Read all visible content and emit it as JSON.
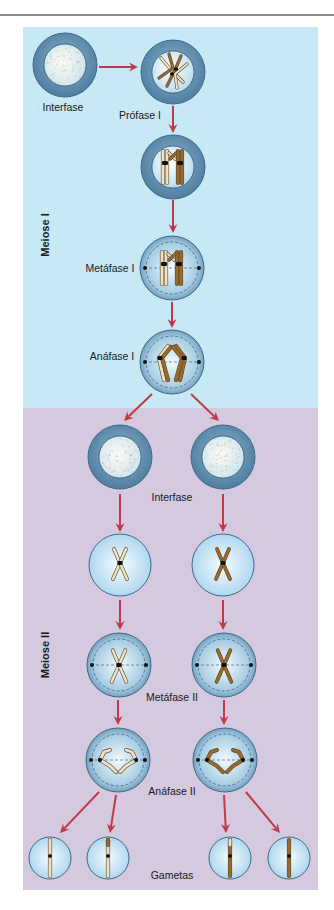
{
  "sections": [
    {
      "id": "meiose1",
      "label": "Meiose I",
      "color": "#c7e9f6",
      "label_pos": [
        45,
        235
      ]
    },
    {
      "id": "meiose2",
      "label": "Meiose II",
      "color": "#d4c9df",
      "label_pos": [
        45,
        655
      ]
    }
  ],
  "stage_labels": [
    {
      "id": "interfase-1",
      "text": "Interfase",
      "x": 63,
      "y": 107
    },
    {
      "id": "profase-1",
      "text": "Prófase I",
      "x": 140,
      "y": 115
    },
    {
      "id": "metafase-1",
      "text": "Metáfase I",
      "x": 110,
      "y": 268
    },
    {
      "id": "anafase-1",
      "text": "Anáfase I",
      "x": 112,
      "y": 356
    },
    {
      "id": "interfase-2",
      "text": "Interfase",
      "x": 172,
      "y": 497
    },
    {
      "id": "metafase-2",
      "text": "Metáfase II",
      "x": 172,
      "y": 697
    },
    {
      "id": "anafase-2",
      "text": "Anáfase II",
      "x": 172,
      "y": 791
    },
    {
      "id": "gametas",
      "text": "Gametas",
      "x": 172,
      "y": 875
    }
  ],
  "cells": [
    {
      "id": "interfase-1",
      "type": "interphase",
      "cx": 65,
      "cy": 65,
      "r": 32,
      "color": "mixed"
    },
    {
      "id": "profase-1",
      "type": "prophase1",
      "cx": 173,
      "cy": 72,
      "r": 32,
      "color": "mixed"
    },
    {
      "id": "profase-1b",
      "type": "synapsis",
      "cx": 173,
      "cy": 167,
      "r": 32,
      "color": "mixed"
    },
    {
      "id": "metafase-1",
      "type": "metaphase1",
      "cx": 172,
      "cy": 268,
      "r": 32,
      "color": "mixed"
    },
    {
      "id": "anafase-1",
      "type": "anaphase1",
      "cx": 172,
      "cy": 362,
      "r": 32,
      "color": "mixed"
    },
    {
      "id": "interfase-2a",
      "type": "interphase",
      "cx": 120,
      "cy": 457,
      "r": 32,
      "color": "light"
    },
    {
      "id": "interfase-2b",
      "type": "interphase",
      "cx": 223,
      "cy": 457,
      "r": 32,
      "color": "dark"
    },
    {
      "id": "profase-2a",
      "type": "prophase2",
      "cx": 120,
      "cy": 565,
      "r": 31,
      "color": "light"
    },
    {
      "id": "profase-2b",
      "type": "prophase2",
      "cx": 223,
      "cy": 565,
      "r": 31,
      "color": "dark"
    },
    {
      "id": "metafase-2a",
      "type": "metaphase2",
      "cx": 119,
      "cy": 665,
      "r": 32,
      "color": "light"
    },
    {
      "id": "metafase-2b",
      "type": "metaphase2",
      "cx": 224,
      "cy": 665,
      "r": 32,
      "color": "dark"
    },
    {
      "id": "anafase-2a",
      "type": "anaphase2",
      "cx": 118,
      "cy": 760,
      "r": 32,
      "color": "light"
    },
    {
      "id": "anafase-2b",
      "type": "anaphase2",
      "cx": 225,
      "cy": 760,
      "r": 32,
      "color": "dark"
    },
    {
      "id": "gameta-1",
      "type": "gamete",
      "cx": 50,
      "cy": 858,
      "r": 21,
      "color": "light"
    },
    {
      "id": "gameta-2",
      "type": "gamete",
      "cx": 108,
      "cy": 858,
      "r": 21,
      "color": "light-tip"
    },
    {
      "id": "gameta-3",
      "type": "gamete",
      "cx": 230,
      "cy": 858,
      "r": 21,
      "color": "dark-tip"
    },
    {
      "id": "gameta-4",
      "type": "gamete",
      "cx": 289,
      "cy": 858,
      "r": 21,
      "color": "dark"
    }
  ],
  "arrows": [
    {
      "x1": 99,
      "y1": 67,
      "x2": 138,
      "y2": 67
    },
    {
      "x1": 173,
      "y1": 106,
      "x2": 173,
      "y2": 133
    },
    {
      "x1": 173,
      "y1": 200,
      "x2": 173,
      "y2": 233
    },
    {
      "x1": 172,
      "y1": 302,
      "x2": 172,
      "y2": 328
    },
    {
      "x1": 152,
      "y1": 394,
      "x2": 124,
      "y2": 421
    },
    {
      "x1": 191,
      "y1": 394,
      "x2": 219,
      "y2": 421
    },
    {
      "x1": 120,
      "y1": 494,
      "x2": 120,
      "y2": 532
    },
    {
      "x1": 223,
      "y1": 494,
      "x2": 223,
      "y2": 532
    },
    {
      "x1": 120,
      "y1": 600,
      "x2": 120,
      "y2": 630
    },
    {
      "x1": 223,
      "y1": 600,
      "x2": 223,
      "y2": 630
    },
    {
      "x1": 118,
      "y1": 700,
      "x2": 118,
      "y2": 725
    },
    {
      "x1": 224,
      "y1": 700,
      "x2": 224,
      "y2": 725
    },
    {
      "x1": 99,
      "y1": 792,
      "x2": 60,
      "y2": 833
    },
    {
      "x1": 116,
      "y1": 795,
      "x2": 110,
      "y2": 833
    },
    {
      "x1": 224,
      "y1": 795,
      "x2": 226,
      "y2": 833
    },
    {
      "x1": 246,
      "y1": 792,
      "x2": 280,
      "y2": 833
    }
  ],
  "palette": {
    "arrow": "#c0394b",
    "cell_ring": "#5a87a6",
    "cell_inner": "#d6effa",
    "chrom_light": "#efe2c4",
    "chrom_dark": "#9a6a2c",
    "centromere": "#111111"
  }
}
